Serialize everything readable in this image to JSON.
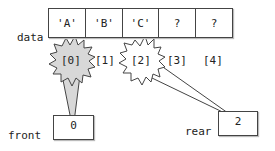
{
  "array": {
    "name": "data",
    "cells": [
      "'A'",
      "'B'",
      "'C'",
      "?",
      "?"
    ],
    "indices": [
      "[0]",
      "[1]",
      "[2]",
      "[3]",
      "[4]"
    ]
  },
  "front": {
    "label": "front",
    "value": "0"
  },
  "rear": {
    "label": "rear",
    "value": "2"
  },
  "colors": {
    "highlight_fill": "#d8d8d8",
    "stroke": "#444444"
  }
}
